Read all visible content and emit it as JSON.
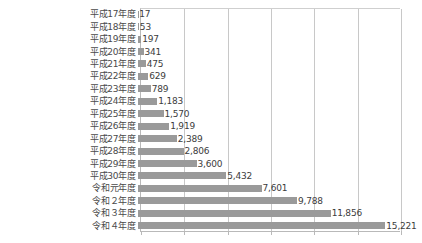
{
  "chart_data": {
    "type": "bar",
    "orientation": "horizontal",
    "title": "",
    "xlabel": "",
    "ylabel": "",
    "xlim": [
      0,
      16000
    ],
    "grid": true,
    "legend": "none",
    "gridline_values": [
      0,
      2667,
      5333,
      8000,
      10667,
      13333,
      16000
    ],
    "bar_color": "#9a9a9a",
    "axis_color": "#b9b9b9",
    "categories": [
      "平成17年度",
      "平成18年度",
      "平成19年度",
      "平成20年度",
      "平成21年度",
      "平成22年度",
      "平成23年度",
      "平成24年度",
      "平成25年度",
      "平成26年度",
      "平成27年度",
      "平成28年度",
      "平成29年度",
      "平成30年度",
      "令和元年度",
      "令和２年度",
      "令和３年度",
      "令和４年度"
    ],
    "values": [
      17,
      53,
      197,
      341,
      475,
      629,
      789,
      1183,
      1570,
      1919,
      2389,
      2806,
      3600,
      5432,
      7601,
      9788,
      11856,
      15221
    ],
    "value_labels": [
      "17",
      "53",
      "197",
      "341",
      "475",
      "629",
      "789",
      "1,183",
      "1,570",
      "1,919",
      "2,389",
      "2,806",
      "3,600",
      "5,432",
      "7,601",
      "9,788",
      "11,856",
      "15,221"
    ]
  }
}
